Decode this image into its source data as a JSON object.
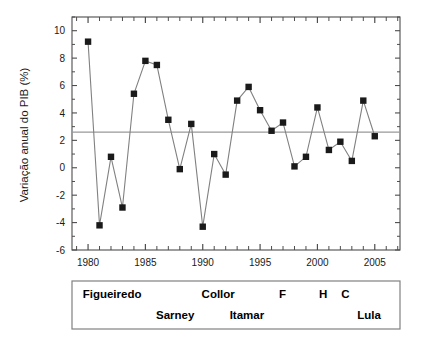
{
  "chart_data": {
    "type": "line",
    "title": "",
    "xlabel": "",
    "ylabel": "Variação anual do PIB (%)",
    "xlim": [
      1978.6,
      2007.2
    ],
    "ylim": [
      -6,
      11
    ],
    "yticks": [
      -6,
      -4,
      -2,
      0,
      2,
      4,
      6,
      8,
      10
    ],
    "xticks": [
      1980,
      1985,
      1990,
      1995,
      2000,
      2005
    ],
    "xtick_labels": [
      "1980",
      "1985",
      "1990",
      "1995",
      "2000",
      "2005"
    ],
    "ytick_labels": [
      "-6",
      "-4",
      "-2",
      "0",
      "2",
      "4",
      "6",
      "8",
      "10"
    ],
    "grid": false,
    "legend": "none",
    "minor_ticks": "every 1 year on x-axis",
    "marker": "filled-square",
    "series": [
      {
        "name": "Variação anual do PIB (%)",
        "x": [
          1980,
          1981,
          1982,
          1983,
          1984,
          1985,
          1986,
          1987,
          1988,
          1989,
          1990,
          1991,
          1992,
          1993,
          1994,
          1995,
          1996,
          1997,
          1998,
          1999,
          2000,
          2001,
          2002,
          2003,
          2004,
          2005
        ],
        "values": [
          9.2,
          -4.2,
          0.8,
          -2.9,
          5.4,
          7.8,
          7.5,
          3.5,
          -0.1,
          3.2,
          -4.3,
          1.0,
          -0.5,
          4.9,
          5.9,
          4.2,
          2.7,
          3.3,
          0.1,
          0.8,
          4.4,
          1.3,
          1.9,
          0.5,
          4.9,
          2.3
        ]
      }
    ],
    "reference_line": {
      "value": 2.6,
      "orientation": "horizontal",
      "label": ""
    }
  },
  "annotations": {
    "presidents_box": {
      "row_top": [
        {
          "label": "Figueiredo",
          "x_start": 1979.0,
          "x_end": 1985.2
        },
        {
          "label": "Collor",
          "x_start": 1990.0,
          "x_end": 1992.7
        },
        {
          "label": "F",
          "x_start": 1995.0,
          "x_end": 1998.9
        },
        {
          "label": "H",
          "x_start": 1999.0,
          "x_end": 2002.0
        },
        {
          "label": "C",
          "x_start": 2002.0,
          "x_end": 2002.9
        }
      ],
      "row_bottom": [
        {
          "label": "Sarney",
          "x_start": 1985.2,
          "x_end": 1990.0
        },
        {
          "label": "Itamar",
          "x_start": 1992.7,
          "x_end": 1995.0
        },
        {
          "label": "Lula",
          "x_start": 2003.0,
          "x_end": 2006.0
        }
      ]
    }
  },
  "colors": {
    "marker": "#1a1a1a",
    "line": "#808080",
    "axis": "#4d4d4d",
    "reference_line": "#999999",
    "legend_border": "#808080",
    "background": "#ffffff"
  }
}
